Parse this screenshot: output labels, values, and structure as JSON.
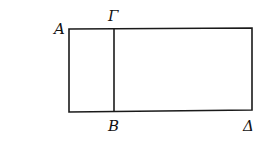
{
  "figure": {
    "type": "geometric-diagram",
    "points": {
      "A": {
        "label": "Α",
        "x": 69,
        "y": 28
      },
      "G": {
        "label": "Γ",
        "x": 114,
        "y": 28
      },
      "B": {
        "label": "Β",
        "x": 114,
        "y": 112
      },
      "D": {
        "label": "Δ",
        "x": 252,
        "y": 110
      }
    },
    "labels": {
      "A": "A",
      "G": "Γ",
      "B": "B",
      "D": "Δ"
    },
    "colors": {
      "line": "#1a1a1a",
      "background": "#ffffff"
    }
  }
}
